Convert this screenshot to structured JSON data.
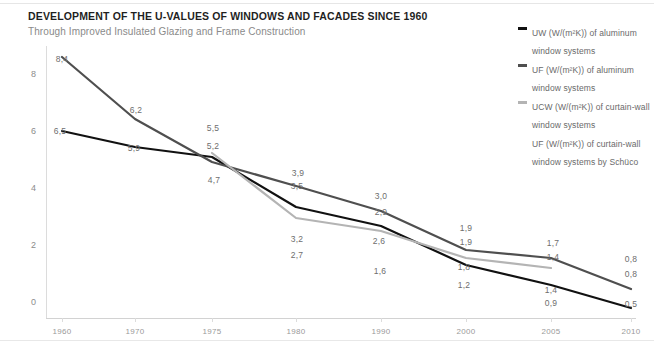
{
  "header": {
    "title": "DEVELOPMENT OF THE U-VALUES OF WINDOWS AND FACADES SINCE 1960",
    "subtitle": "Through Improved Insulated Glazing and Frame Construction"
  },
  "legend": {
    "items": [
      {
        "label": "UW (W/(m²K)) of aluminum window systems",
        "color": "#111111",
        "has_marker": true
      },
      {
        "label": "UF (W/(m²K)) of aluminum window systems",
        "color": "#4f4f4f",
        "has_marker": true
      },
      {
        "label": "UCW (W/(m²K)) of curtain-wall window systems",
        "color": "#b4b4b4",
        "has_marker": true
      },
      {
        "label": "UF (W/(m²K)) of curtain-wall window systems by Schüco",
        "color": "#9a9a9a",
        "has_marker": false
      }
    ]
  },
  "chart_data": {
    "type": "line",
    "title": "DEVELOPMENT OF THE U-VALUES OF WINDOWS AND FACADES SINCE 1960",
    "subtitle": "Through Improved Insulated Glazing and Frame Construction",
    "xlabel": "",
    "ylabel": "",
    "categories": [
      "1960",
      "1970",
      "1975",
      "1980",
      "1990",
      "2000",
      "2005",
      "2010"
    ],
    "x_ticks": [
      "1960",
      "1970",
      "1975",
      "1980",
      "1990",
      "2000",
      "2005",
      "2010"
    ],
    "y_ticks": [
      "0",
      "2",
      "4",
      "6",
      "8"
    ],
    "ylim": [
      0,
      9
    ],
    "grid": false,
    "legend_position": "top-right",
    "decimal_separator": ",",
    "series": [
      {
        "name": "UW (W/(m²K)) of aluminum window systems",
        "color": "#111111",
        "x": [
          "1960",
          "1970",
          "1975",
          "1980",
          "1990",
          "2000",
          "2005",
          "2010"
        ],
        "values": [
          6.5,
          5.9,
          5.5,
          3.5,
          2.9,
          1.9,
          1.4,
          0.8
        ],
        "labels": [
          "6,5",
          "5,9",
          "5,5",
          "3,5",
          "2,9",
          "1,9",
          "1,4",
          "0,8"
        ]
      },
      {
        "name": "UF (W/(m²K)) of aluminum window systems",
        "color": "#4f4f4f",
        "x": [
          "1960",
          "1970",
          "1975",
          "1980",
          "1990",
          "2000",
          "2005",
          "2010"
        ],
        "values": [
          8.4,
          6.2,
          4.7,
          3.9,
          3.0,
          1.9,
          1.7,
          0.8
        ],
        "labels": [
          "8,4",
          "6,2",
          "4,7",
          "3,9",
          "3,0",
          "1,9",
          "1,7",
          "0,8"
        ]
      },
      {
        "name": "UCW (W/(m²K)) of curtain-wall window systems",
        "color": "#b4b4b4",
        "x": [
          "1975",
          "1980",
          "1990",
          "2000",
          "2005"
        ],
        "values": [
          5.2,
          3.2,
          2.6,
          1.8,
          1.4
        ],
        "labels": [
          "5,2",
          "3,2",
          "2,6",
          "1,8",
          "1,4"
        ]
      },
      {
        "name": "UF (W/(m²K)) of curtain-wall window systems by Schüco",
        "color": "#9a9a9a",
        "x": [
          "1980",
          "1990",
          "2000",
          "2005",
          "2010"
        ],
        "values": [
          2.7,
          1.6,
          1.2,
          0.9,
          0.5
        ],
        "labels": [
          "2,7",
          "1,6",
          "1,2",
          "0,9",
          "0,5"
        ],
        "line_drawn": false
      }
    ]
  },
  "axis": {
    "y_labels": [
      "8",
      "6",
      "4",
      "2",
      "0"
    ],
    "x_labels": [
      "1960",
      "1970",
      "1975",
      "1980",
      "1990",
      "2000",
      "2005",
      "2010"
    ]
  },
  "data_labels": [
    {
      "text": "8,4",
      "x": 62,
      "y": 59
    },
    {
      "text": "6,5",
      "x": 60,
      "y": 131
    },
    {
      "text": "6,2",
      "x": 136,
      "y": 110
    },
    {
      "text": "5,9",
      "x": 134,
      "y": 148
    },
    {
      "text": "5,5",
      "x": 213,
      "y": 128
    },
    {
      "text": "5,2",
      "x": 213,
      "y": 146
    },
    {
      "text": "4,7",
      "x": 214,
      "y": 180
    },
    {
      "text": "3,9",
      "x": 298,
      "y": 173
    },
    {
      "text": "3,5",
      "x": 297,
      "y": 186
    },
    {
      "text": "3,2",
      "x": 297,
      "y": 239
    },
    {
      "text": "2,7",
      "x": 297,
      "y": 255
    },
    {
      "text": "3,0",
      "x": 381,
      "y": 196
    },
    {
      "text": "2,9",
      "x": 381,
      "y": 212
    },
    {
      "text": "2,6",
      "x": 379,
      "y": 241
    },
    {
      "text": "1,6",
      "x": 380,
      "y": 271
    },
    {
      "text": "1,9",
      "x": 466,
      "y": 228
    },
    {
      "text": "1,9",
      "x": 466,
      "y": 242
    },
    {
      "text": "1,8",
      "x": 464,
      "y": 267
    },
    {
      "text": "1,2",
      "x": 464,
      "y": 285
    },
    {
      "text": "1,7",
      "x": 553,
      "y": 243
    },
    {
      "text": "1,4",
      "x": 553,
      "y": 257
    },
    {
      "text": "1,4",
      "x": 551,
      "y": 290
    },
    {
      "text": "0,9",
      "x": 551,
      "y": 303
    },
    {
      "text": "0,8",
      "x": 631,
      "y": 259
    },
    {
      "text": "0,8",
      "x": 631,
      "y": 274
    },
    {
      "text": "0,5",
      "x": 631,
      "y": 304
    }
  ],
  "geometry": {
    "x_positions": [
      62,
      135,
      212,
      296,
      381,
      466,
      551,
      631
    ],
    "y_tick_positions": [
      74,
      131,
      188,
      245,
      302
    ],
    "paths": {
      "uw": "M 62,131 L 135,147 L 212,157 L 296,207 L 381,226 L 466,265 L 551,285 L 631,308",
      "uf": "M 62,57  L 135,119 L 212,162 L 296,186 L 381,211 L 466,250 L 551,258 L 631,289",
      "ucw": "M 212,153 L 296,218 L 381,231 L 466,258 L 551,268",
      "ufcw": ""
    }
  }
}
